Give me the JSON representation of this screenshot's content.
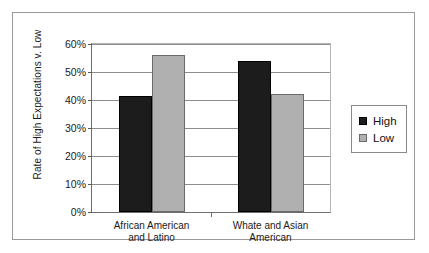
{
  "chart_data": {
    "type": "bar",
    "title": "",
    "xlabel": "",
    "ylabel": "Rate of High Expectations v. Low",
    "categories": [
      "African American and Latino",
      "Whate and Asian American"
    ],
    "category_lines": [
      [
        "African American",
        "and Latino"
      ],
      [
        "Whate and Asian",
        "American"
      ]
    ],
    "series": [
      {
        "name": "High",
        "color": "#1c1c1c",
        "values": [
          41.5,
          54.0
        ]
      },
      {
        "name": "Low",
        "color": "#b0b0b0",
        "values": [
          56.0,
          42.0
        ]
      }
    ],
    "ylim": [
      0,
      60
    ],
    "ytick_values": [
      60,
      50,
      40,
      30,
      20,
      10,
      0
    ],
    "ytick_labels": [
      "60%",
      "50%",
      "40%",
      "30%",
      "20%",
      "10%",
      "0%"
    ],
    "grid": true,
    "legend_position": "right"
  },
  "legend": {
    "entries": [
      {
        "label": "High",
        "swatch": "high-swatch"
      },
      {
        "label": "Low",
        "swatch": "low-swatch"
      }
    ]
  }
}
